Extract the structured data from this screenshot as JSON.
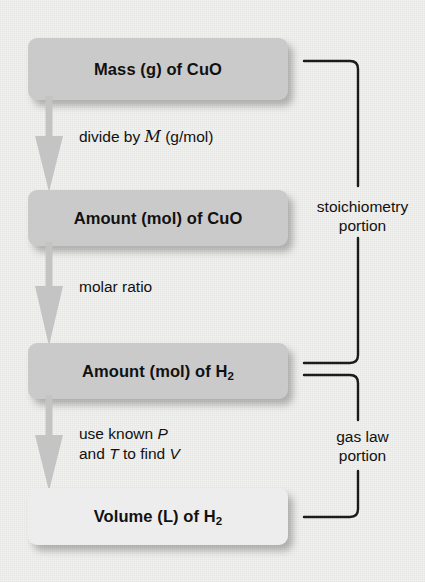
{
  "diagram": {
    "colors": {
      "background": "#f2f2f0",
      "node_fill": "#cacaca",
      "node_fill_light": "#ededed",
      "arrow_fill": "#c4c4c4",
      "bracket_stroke": "#1b1b1b",
      "text": "#111111"
    },
    "nodes": [
      {
        "id": "mass-cuo",
        "label": "Mass (g) of CuO",
        "formula_prefix": "Mass (g) of CuO",
        "subscript": "",
        "tone": "dark"
      },
      {
        "id": "amount-cuo",
        "label": "Amount (mol) of CuO",
        "formula_prefix": "Amount (mol) of CuO",
        "subscript": "",
        "tone": "dark"
      },
      {
        "id": "amount-h2",
        "label": "Amount (mol) of H2",
        "formula_prefix": "Amount (mol) of H",
        "subscript": "2",
        "tone": "dark"
      },
      {
        "id": "volume-h2",
        "label": "Volume (L) of H2",
        "formula_prefix": "Volume (L) of H",
        "subscript": "2",
        "tone": "light"
      }
    ],
    "edges": [
      {
        "id": "divide-by-molar-mass",
        "line1_before": "divide by ",
        "symbol": "M",
        "line1_after": " (g/mol)",
        "line2_before": "",
        "line2_symbol": "",
        "line2_after": ""
      },
      {
        "id": "molar-ratio",
        "line1_before": "molar ratio",
        "symbol": "",
        "line1_after": "",
        "line2_before": "",
        "line2_symbol": "",
        "line2_after": ""
      },
      {
        "id": "use-known-p-and-t",
        "line1_before": "use known ",
        "symbol": "P",
        "line1_after": "",
        "line2_before": "and ",
        "line2_symbol": "T",
        "line2_after": " to find "
      }
    ],
    "edge3_final_symbol": "V",
    "brackets": [
      {
        "id": "stoichiometry",
        "line1": "stoichiometry",
        "line2": "portion"
      },
      {
        "id": "gas-law",
        "line1": "gas law",
        "line2": "portion"
      }
    ]
  }
}
